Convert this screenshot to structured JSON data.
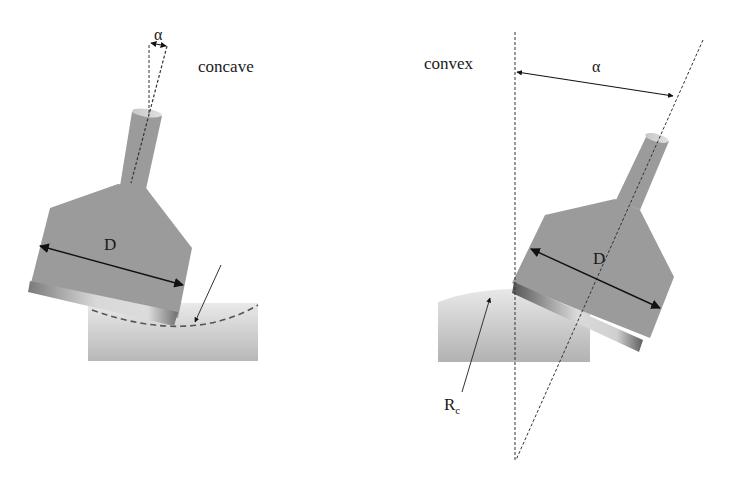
{
  "diagram": {
    "panels": [
      {
        "id": "concave",
        "label": "concave",
        "angle_label": "α",
        "diameter_label": "D"
      },
      {
        "id": "convex",
        "label": "convex",
        "angle_label": "α",
        "diameter_label": "D",
        "radius_label_main": "R",
        "radius_label_sub": "c"
      }
    ],
    "colors": {
      "tool_fill": "#9a9a9a",
      "workpiece_light": "#e6e6e6",
      "workpiece_dark": "#b4b4b4",
      "line": "#222222"
    }
  }
}
